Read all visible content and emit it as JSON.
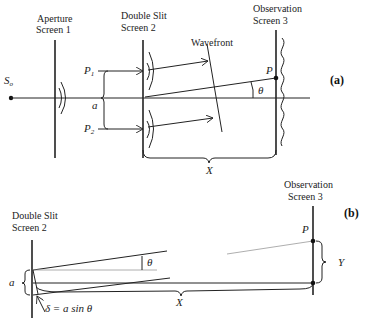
{
  "figure_a": {
    "panel_label": "(a)",
    "aperture_screen": {
      "line1": "Aperture",
      "line2": "Screen 1"
    },
    "double_slit_screen": {
      "line1": "Double Slit",
      "line2": "Screen 2"
    },
    "observation_screen": {
      "line1": "Observation",
      "line2": "Screen 3"
    },
    "source_label": "S",
    "source_subscript": "o",
    "p1_label": "P",
    "p1_subscript": "1",
    "p2_label": "P",
    "p2_subscript": "2",
    "slit_separation_label": "a",
    "wavefront_label": "Wavefront",
    "point_label": "P",
    "angle_label": "θ",
    "distance_label": "X"
  },
  "figure_b": {
    "panel_label": "(b)",
    "double_slit_screen": {
      "line1": "Double Slit",
      "line2": "Screen 2"
    },
    "observation_screen": {
      "line1": "Observation",
      "line2": "Screen 3"
    },
    "slit_separation_label": "a",
    "angle_label": "θ",
    "path_difference_label": "δ = a sin θ",
    "point_label": "P",
    "distance_label": "X",
    "height_label": "Y"
  }
}
